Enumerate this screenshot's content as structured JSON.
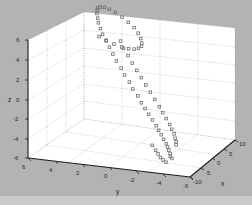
{
  "figure": {
    "background_color": "#b3b3b3",
    "axes_background_color": "#ffffff",
    "grid_color": "#9a9a9a",
    "axis_line_color": "#1f1f1f",
    "marker_color": "#6e6e6e",
    "marker_symbol": "square-open",
    "strip_color": "#c9c9c9"
  },
  "chart_data": {
    "type": "scatter",
    "projection": "3d",
    "title": "",
    "xlabel": "x",
    "ylabel": "y",
    "zlabel": "z",
    "xlim": [
      -10,
      10
    ],
    "ylim": [
      -6,
      6
    ],
    "zlim": [
      -6,
      6
    ],
    "xticks": [
      -10,
      -5,
      0,
      5,
      10
    ],
    "xticklabels": [
      "-10",
      "-5",
      "0",
      "5",
      "10"
    ],
    "yticks": [
      -6,
      -4,
      -2,
      0,
      2,
      4,
      6
    ],
    "yticklabels": [
      "-6",
      "-4",
      "-2",
      "0",
      "2",
      "4",
      "6"
    ],
    "zticks": [
      -6,
      -4,
      -2,
      0,
      2,
      4,
      6
    ],
    "zticklabels": [
      "-6",
      "-4",
      "-2",
      "0",
      "2",
      "4",
      "6"
    ],
    "grid": true,
    "grid_style": "dotted",
    "legend": null,
    "view": {
      "azimuth": -37.5,
      "elevation": 30
    },
    "series": [
      {
        "name": "trajectory",
        "marker": "square-open",
        "color": "#6e6e6e",
        "points": [
          [
            -9.7,
            -4.6,
            -4.4
          ],
          [
            -9.3,
            -4.4,
            -4.3
          ],
          [
            -8.9,
            -4.3,
            -4.1
          ],
          [
            -8.4,
            -4.1,
            -3.9
          ],
          [
            -7.9,
            -3.9,
            -3.7
          ],
          [
            -7.4,
            -3.7,
            -3.5
          ],
          [
            -6.9,
            -3.4,
            -3.2
          ],
          [
            -6.3,
            -3.1,
            -2.9
          ],
          [
            -5.8,
            -2.8,
            -2.6
          ],
          [
            -5.2,
            -2.5,
            -2.3
          ],
          [
            -4.6,
            -2.1,
            -1.9
          ],
          [
            -4.0,
            -1.7,
            -1.5
          ],
          [
            -3.4,
            -1.3,
            -1.1
          ],
          [
            -2.8,
            -0.9,
            -0.7
          ],
          [
            -2.1,
            -0.5,
            -0.2
          ],
          [
            -1.5,
            0.0,
            0.3
          ],
          [
            -0.8,
            0.4,
            0.8
          ],
          [
            -0.1,
            0.9,
            1.3
          ],
          [
            0.6,
            1.3,
            1.8
          ],
          [
            1.3,
            1.8,
            2.3
          ],
          [
            2.0,
            2.2,
            2.8
          ],
          [
            2.7,
            2.6,
            3.3
          ],
          [
            3.4,
            3.0,
            3.8
          ],
          [
            4.1,
            3.4,
            4.2
          ],
          [
            4.8,
            3.7,
            4.6
          ],
          [
            5.5,
            4.0,
            5.0
          ],
          [
            6.2,
            4.2,
            5.3
          ],
          [
            6.9,
            4.4,
            5.6
          ],
          [
            7.5,
            4.5,
            5.8
          ],
          [
            8.1,
            4.6,
            5.9
          ],
          [
            8.6,
            4.5,
            5.9
          ],
          [
            9.1,
            4.3,
            5.8
          ],
          [
            9.4,
            4.0,
            5.6
          ],
          [
            9.6,
            3.6,
            5.3
          ],
          [
            9.6,
            3.1,
            4.9
          ],
          [
            9.4,
            2.6,
            4.5
          ],
          [
            9.1,
            2.1,
            4.1
          ],
          [
            8.6,
            1.7,
            3.7
          ],
          [
            8.1,
            1.4,
            3.3
          ],
          [
            7.5,
            1.2,
            3.0
          ],
          [
            6.9,
            1.1,
            2.8
          ],
          [
            6.3,
            1.2,
            2.7
          ],
          [
            5.7,
            1.4,
            2.7
          ],
          [
            5.2,
            1.7,
            2.8
          ],
          [
            4.7,
            2.1,
            3.0
          ],
          [
            4.3,
            2.6,
            3.3
          ],
          [
            4.0,
            3.1,
            3.6
          ],
          [
            3.8,
            3.6,
            4.0
          ],
          [
            -8.7,
            -4.7,
            -3.2
          ],
          [
            -8.2,
            -4.6,
            -3.0
          ],
          [
            -7.6,
            -4.4,
            -2.8
          ],
          [
            -7.0,
            -4.2,
            -2.5
          ],
          [
            -6.4,
            -3.9,
            -2.2
          ],
          [
            -5.7,
            -3.6,
            -1.9
          ],
          [
            -5.0,
            -3.2,
            -1.5
          ],
          [
            -4.3,
            -2.8,
            -1.1
          ],
          [
            -3.6,
            -2.4,
            -0.7
          ],
          [
            -2.8,
            -1.9,
            -0.2
          ],
          [
            -2.0,
            -1.4,
            0.3
          ],
          [
            -1.2,
            -0.9,
            0.8
          ],
          [
            -0.4,
            -0.4,
            1.3
          ],
          [
            0.4,
            0.1,
            1.8
          ],
          [
            1.2,
            0.6,
            2.3
          ],
          [
            2.1,
            1.1,
            2.8
          ],
          [
            2.9,
            1.6,
            3.3
          ],
          [
            3.8,
            2.0,
            3.8
          ],
          [
            -9.9,
            -4.2,
            -4.8
          ],
          [
            -9.5,
            -3.9,
            -4.7
          ],
          [
            -9.0,
            -3.6,
            -4.6
          ],
          [
            -8.4,
            -3.3,
            -4.4
          ],
          [
            -7.8,
            -3.0,
            -4.2
          ],
          [
            -7.1,
            -2.6,
            -3.9
          ]
        ]
      }
    ]
  },
  "axis_labels": {
    "x": "x",
    "y": "y",
    "z": "z"
  }
}
